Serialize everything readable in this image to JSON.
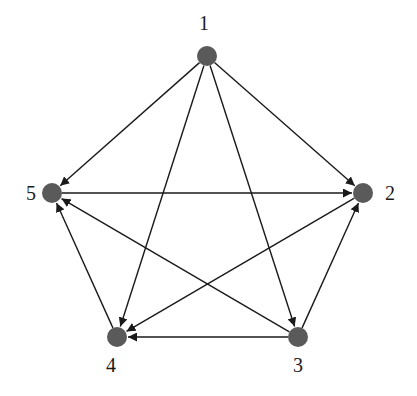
{
  "diagram": {
    "type": "directed-graph",
    "colors": {
      "node": "#5a5a5a",
      "edge": "#1a1a1a",
      "label": "#1a1a1a",
      "background": "#ffffff"
    },
    "nodes": [
      {
        "id": "1",
        "label": "1",
        "x": 207,
        "y": 56,
        "lx": 204,
        "ly": 30
      },
      {
        "id": "2",
        "label": "2",
        "x": 363,
        "y": 193,
        "lx": 390,
        "ly": 200
      },
      {
        "id": "3",
        "label": "3",
        "x": 298,
        "y": 337,
        "lx": 298,
        "ly": 372
      },
      {
        "id": "4",
        "label": "4",
        "x": 117,
        "y": 337,
        "lx": 111,
        "ly": 372
      },
      {
        "id": "5",
        "label": "5",
        "x": 52,
        "y": 193,
        "lx": 31,
        "ly": 200
      }
    ],
    "edges": [
      {
        "from": "1",
        "to": "5"
      },
      {
        "from": "1",
        "to": "2"
      },
      {
        "from": "1",
        "to": "4"
      },
      {
        "from": "1",
        "to": "3"
      },
      {
        "from": "5",
        "to": "2"
      },
      {
        "from": "2",
        "to": "4"
      },
      {
        "from": "3",
        "to": "2"
      },
      {
        "from": "3",
        "to": "5"
      },
      {
        "from": "3",
        "to": "4"
      },
      {
        "from": "4",
        "to": "5"
      }
    ]
  }
}
